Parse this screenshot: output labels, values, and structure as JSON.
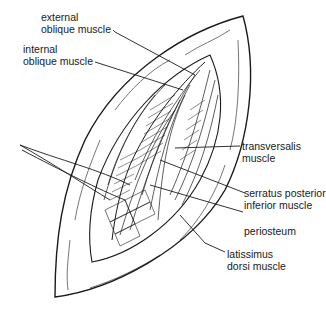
{
  "figure": {
    "labels": [
      {
        "id": "external-oblique",
        "line1": "external",
        "line2": "oblique muscle"
      },
      {
        "id": "internal-oblique",
        "line1": "internal",
        "line2": "oblique muscle"
      },
      {
        "id": "transversalis",
        "line1": "transversalis",
        "line2": "muscle"
      },
      {
        "id": "serratus-posterior-inferior",
        "line1": "serratus posterior",
        "line2": "inferior muscle"
      },
      {
        "id": "periosteum",
        "line1": "periosteum",
        "line2": ""
      },
      {
        "id": "latissimus-dorsi",
        "line1": "latissimus",
        "line2": "dorsi muscle"
      }
    ],
    "colors": {
      "ink": "#1a1a1a",
      "background": "#ffffff"
    }
  }
}
